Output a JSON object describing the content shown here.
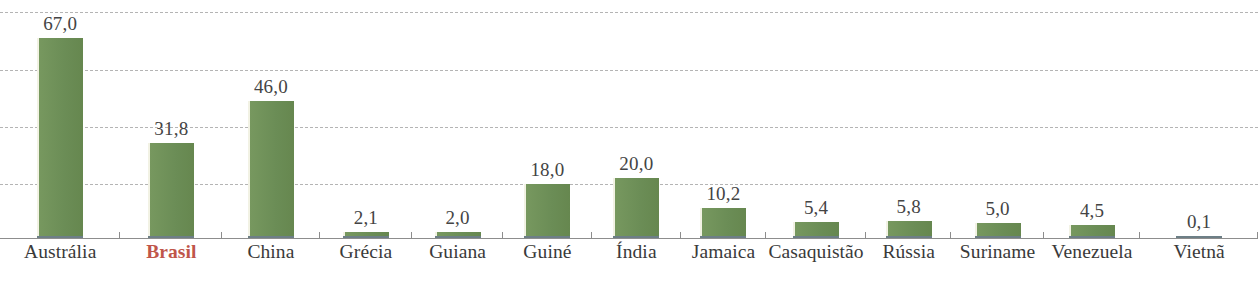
{
  "chart_data": {
    "type": "bar",
    "title": "",
    "xlabel": "",
    "ylabel": "",
    "ylim": [
      0,
      76
    ],
    "grid": true,
    "gridlines": [
      0,
      19,
      38,
      57,
      76
    ],
    "legend": "none",
    "decimal_separator": ",",
    "highlight_category": "Brasil",
    "categories": [
      "Austrália",
      "Brasil",
      "China",
      "Grécia",
      "Guiana",
      "Guiné",
      "Índia",
      "Jamaica",
      "Casaquistão",
      "Rússia",
      "Suriname",
      "Venezuela",
      "Vietnã"
    ],
    "values": [
      67.0,
      31.8,
      46.0,
      2.1,
      2.0,
      18.0,
      20.0,
      10.2,
      5.4,
      5.8,
      5.0,
      4.5,
      0.1
    ],
    "value_labels": [
      "67,0",
      "31,8",
      "46,0",
      "2,1",
      "2,0",
      "18,0",
      "20,0",
      "10,2",
      "5,4",
      "5,8",
      "5,0",
      "4,5",
      "0,1"
    ]
  },
  "colors": {
    "bar_fill": "#6d9058",
    "bar_base_shadow": "#6d7f86",
    "highlight_text": "#c0564a",
    "label_text": "#3a3a3a",
    "value_text": "#444444",
    "gridline": "#a8a8a8",
    "axis_line": "#8d8d8d",
    "background": "#ffffff"
  }
}
